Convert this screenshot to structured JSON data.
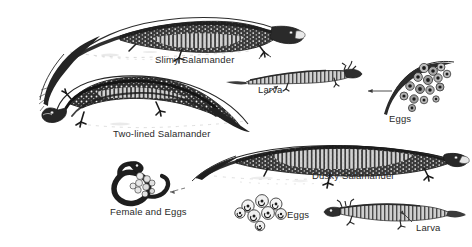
{
  "plate": {
    "title": "Salamander life stages illustration plate",
    "background_color": "#ffffff",
    "ink_color": "#2a2a2a",
    "width": 472,
    "height": 247
  },
  "labels": {
    "slimy_salamander": "Slimy Salamander",
    "larva_top": "Larva",
    "eggs_top": "Eggs",
    "two_lined_salamander": "Two-lined Salamander",
    "dusky_salamander": "Dusky Salamander",
    "female_and_eggs": "Female and Eggs",
    "eggs_bottom": "Eggs",
    "larva_bottom": "Larva"
  },
  "figures": [
    {
      "name": "slimy-salamander",
      "label": "Slimy Salamander",
      "description": "Adult salamander, head at right, long tapering tail curving to lower left",
      "icon": "salamander-adult-icon"
    },
    {
      "name": "larva-top",
      "label": "Larva",
      "description": "Small larva with external gills, head at right",
      "icon": "salamander-larva-icon"
    },
    {
      "name": "eggs-top",
      "label": "Eggs",
      "description": "Cluster of eggs attached to a curved stem or leaf",
      "icon": "egg-cluster-icon"
    },
    {
      "name": "two-lined-salamander",
      "label": "Two-lined Salamander",
      "description": "Adult salamander, head at left, arched back, tail sweeping to lower right",
      "icon": "salamander-adult-icon"
    },
    {
      "name": "dusky-salamander",
      "label": "Dusky Salamander",
      "description": "Adult salamander, head at right, body in a long low arch",
      "icon": "salamander-adult-icon"
    },
    {
      "name": "female-and-eggs",
      "label": "Female and Eggs",
      "description": "Female salamander coiled around a mass of eggs",
      "icon": "salamander-brooding-icon"
    },
    {
      "name": "eggs-bottom",
      "label": "Eggs",
      "description": "Loose rosette cluster of individual eggs",
      "icon": "egg-cluster-icon"
    },
    {
      "name": "larva-bottom",
      "label": "Larva",
      "description": "Slender larva with gills and tail fin, head at left",
      "icon": "salamander-larva-icon"
    }
  ],
  "annotations": [
    {
      "name": "leader-larva-top",
      "points_to": "Larva",
      "direction": "up-right"
    },
    {
      "name": "leader-eggs-top",
      "points_to": "Eggs",
      "direction": "left"
    },
    {
      "name": "leader-larva-bottom",
      "points_to": "Larva",
      "direction": "up-left"
    },
    {
      "name": "leader-female-eggs",
      "points_to": "Female and Eggs",
      "direction": "left"
    }
  ]
}
